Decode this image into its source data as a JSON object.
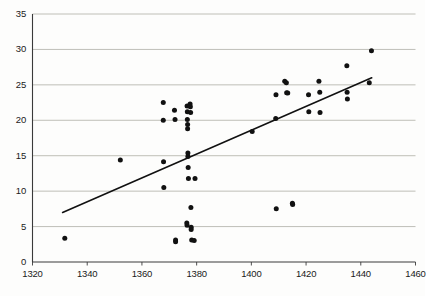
{
  "chart_data": {
    "type": "scatter",
    "title": "",
    "xlabel": "",
    "ylabel": "",
    "xlim": [
      1320,
      1460
    ],
    "ylim": [
      0,
      35
    ],
    "xticks": [
      1320,
      1340,
      1360,
      1380,
      1400,
      1420,
      1440,
      1460
    ],
    "yticks": [
      0,
      5,
      10,
      15,
      20,
      25,
      30,
      35
    ],
    "grid": "horizontal",
    "legend": "none",
    "point_color": "#111111",
    "trendline_color": "#111111",
    "gridline_color": "#b8b8b0",
    "axis_color": "#3a3a3a",
    "points": [
      [
        1331.8,
        3.35
      ],
      [
        1352.1,
        14.4
      ],
      [
        1367.8,
        22.5
      ],
      [
        1367.8,
        20.0
      ],
      [
        1367.9,
        14.15
      ],
      [
        1368.0,
        10.5
      ],
      [
        1371.9,
        21.4
      ],
      [
        1372.1,
        20.1
      ],
      [
        1372.3,
        3.1
      ],
      [
        1372.3,
        2.85
      ],
      [
        1376.5,
        22.0
      ],
      [
        1376.6,
        21.2
      ],
      [
        1376.6,
        20.1
      ],
      [
        1376.7,
        19.4
      ],
      [
        1376.7,
        18.8
      ],
      [
        1376.8,
        15.4
      ],
      [
        1376.8,
        14.9
      ],
      [
        1376.9,
        13.35
      ],
      [
        1377.0,
        11.8
      ],
      [
        1376.4,
        5.5
      ],
      [
        1376.5,
        5.2
      ],
      [
        1377.6,
        22.3
      ],
      [
        1377.7,
        21.9
      ],
      [
        1377.8,
        21.1
      ],
      [
        1377.9,
        7.7
      ],
      [
        1378.0,
        4.9
      ],
      [
        1378.0,
        4.6
      ],
      [
        1378.2,
        3.1
      ],
      [
        1379.1,
        3.05
      ],
      [
        1379.4,
        11.8
      ],
      [
        1400.3,
        18.4
      ],
      [
        1408.9,
        20.25
      ],
      [
        1409.0,
        23.6
      ],
      [
        1409.1,
        7.5
      ],
      [
        1412.2,
        25.5
      ],
      [
        1412.8,
        25.3
      ],
      [
        1412.9,
        23.9
      ],
      [
        1413.3,
        23.85
      ],
      [
        1415.0,
        8.3
      ],
      [
        1415.1,
        8.1
      ],
      [
        1420.9,
        23.6
      ],
      [
        1421.0,
        21.2
      ],
      [
        1424.7,
        25.5
      ],
      [
        1425.0,
        23.95
      ],
      [
        1425.1,
        21.1
      ],
      [
        1434.9,
        27.7
      ],
      [
        1435.0,
        23.95
      ],
      [
        1435.1,
        23.0
      ],
      [
        1443.1,
        25.3
      ],
      [
        1443.9,
        29.8
      ]
    ],
    "trendline": {
      "x0": 1331.0,
      "y0": 7.0,
      "x1": 1444.0,
      "y1": 26.0
    }
  }
}
